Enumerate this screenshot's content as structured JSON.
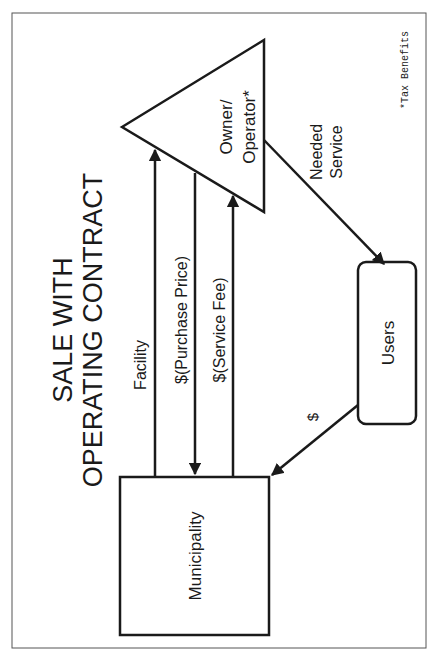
{
  "title": {
    "line1": "SALE WITH",
    "line2": "OPERATING CONTRACT"
  },
  "nodes": {
    "owner_operator": {
      "line1": "Owner/",
      "line2": "Operator*",
      "shape": "triangle"
    },
    "municipality": {
      "label": "Municipality",
      "shape": "rectangle"
    },
    "users": {
      "label": "Users",
      "shape": "rounded-rectangle"
    }
  },
  "edges": {
    "facility": {
      "label": "Facility",
      "from": "Municipality",
      "to": "Owner/Operator"
    },
    "purchase_price": {
      "label": "$(Purchase Price)",
      "from": "Owner/Operator",
      "to": "Municipality"
    },
    "service_fee": {
      "label": "$(Service Fee)",
      "from": "Municipality",
      "to": "Owner/Operator"
    },
    "needed_service": {
      "line1": "Needed",
      "line2": "Service",
      "from": "Owner/Operator",
      "to": "Users"
    },
    "payment": {
      "label": "$",
      "from": "Users",
      "to": "Municipality"
    }
  },
  "footnote": "*Tax Benefits",
  "colors": {
    "stroke": "#1a1a1a",
    "frame": "#555555",
    "background": "#ffffff"
  }
}
